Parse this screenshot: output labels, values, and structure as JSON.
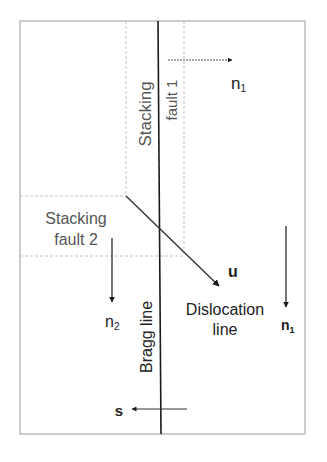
{
  "diagram": {
    "labels": {
      "stacking_fault_1_line1": "Stacking",
      "stacking_fault_1_line2": "fault 1",
      "stacking_fault_2_line1": "Stacking",
      "stacking_fault_2_line2": "fault 2",
      "bragg_line": "Bragg line",
      "dislocation_line1": "Dislocation",
      "dislocation_line2": "line",
      "u": "u",
      "s": "s",
      "n1_top": "n",
      "n1_top_sub": "1",
      "n1_right": "n",
      "n1_right_sub": "1",
      "n2": "n",
      "n2_sub": "2"
    },
    "colors": {
      "line": "#1a1a1a",
      "frame": "#9a9a9a",
      "dashed": "#c4c4c4",
      "text": "#222222",
      "gray_text": "#555555"
    }
  }
}
